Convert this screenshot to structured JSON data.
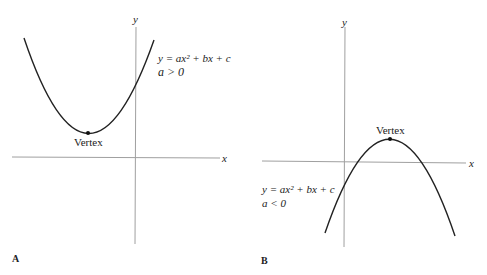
{
  "panels": [
    {
      "id": "A",
      "label": "A",
      "axis_x_label": "x",
      "axis_y_label": "y",
      "equation": "y = ax² + bx + c",
      "condition": "a > 0",
      "vertex_label": "Vertex",
      "opens": "up"
    },
    {
      "id": "B",
      "label": "B",
      "axis_x_label": "x",
      "axis_y_label": "y",
      "equation": "y = ax² + bx + c",
      "condition": "a < 0",
      "vertex_label": "Vertex",
      "opens": "down"
    }
  ],
  "colors": {
    "curve": "#222222",
    "axis": "#9a9a9a",
    "text": "#222222"
  }
}
